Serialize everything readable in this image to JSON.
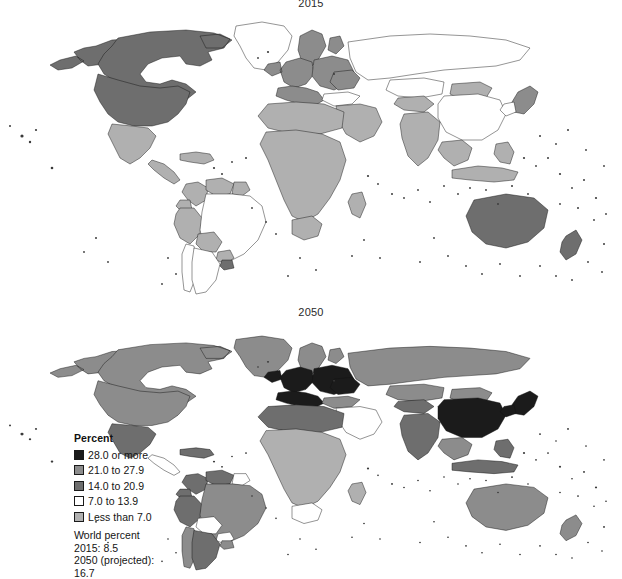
{
  "figure": {
    "panels": [
      {
        "id": "2015",
        "title": "2015"
      },
      {
        "id": "2050",
        "title": "2050"
      }
    ]
  },
  "legend": {
    "title": "Percent",
    "items": [
      {
        "label": "28.0 or more",
        "color": "#1b1b1b"
      },
      {
        "label": "21.0 to 27.9",
        "color": "#8c8c8c"
      },
      {
        "label": "14.0 to 20.9",
        "color": "#6e6e6e"
      },
      {
        "label": "7.0 to 13.9",
        "color": "#ffffff"
      },
      {
        "label": "Less than 7.0",
        "color": "#b0b0b0"
      }
    ],
    "footer": {
      "heading": "World percent",
      "line_2015": "2015: 8.5",
      "line_2050_label": "2050 (projected):",
      "line_2050_value": "16.7"
    }
  },
  "chart_data": {
    "type": "map",
    "map_projection": "world-equirectangular",
    "legend_position": "lower-left",
    "value_units": "percent",
    "classes": [
      {
        "label": "28.0 or more",
        "min": 28.0,
        "max": null,
        "color": "#1b1b1b"
      },
      {
        "label": "21.0 to 27.9",
        "min": 21.0,
        "max": 27.9,
        "color": "#8c8c8c"
      },
      {
        "label": "14.0 to 20.9",
        "min": 14.0,
        "max": 20.9,
        "color": "#6e6e6e"
      },
      {
        "label": "7.0 to 13.9",
        "min": 7.0,
        "max": 13.9,
        "color": "#ffffff"
      },
      {
        "label": "Less than 7.0",
        "min": null,
        "max": 6.9,
        "color": "#b0b0b0"
      }
    ],
    "world_values": {
      "2015": 8.5,
      "2050": 16.7
    },
    "panels": [
      {
        "year": "2015",
        "regions": {
          "greenland": "7.0 to 13.9",
          "canada": "14.0 to 20.9",
          "alaska": "14.0 to 20.9",
          "united_states": "14.0 to 20.9",
          "mexico": "Less than 7.0",
          "central_america": "Less than 7.0",
          "caribbean": "Less than 7.0",
          "colombia": "Less than 7.0",
          "venezuela": "Less than 7.0",
          "guyanas": "Less than 7.0",
          "brazil": "7.0 to 13.9",
          "peru": "Less than 7.0",
          "bolivia": "Less than 7.0",
          "chile": "7.0 to 13.9",
          "argentina": "7.0 to 13.9",
          "uruguay": "14.0 to 20.9",
          "paraguay": "Less than 7.0",
          "ecuador": "Less than 7.0",
          "western_europe": "21.0 to 27.9",
          "northern_europe": "21.0 to 27.9",
          "southern_europe": "21.0 to 27.9",
          "eastern_europe": "21.0 to 27.9",
          "russia": "7.0 to 13.9",
          "ukraine": "21.0 to 27.9",
          "turkey": "7.0 to 13.9",
          "middle_east": "Less than 7.0",
          "north_africa": "Less than 7.0",
          "sub_saharan_africa": "Less than 7.0",
          "south_africa": "Less than 7.0",
          "madagascar": "Less than 7.0",
          "central_asia": "Less than 7.0",
          "kazakhstan": "7.0 to 13.9",
          "mongolia": "Less than 7.0",
          "china": "7.0 to 13.9",
          "japan": "21.0 to 27.9",
          "south_korea": "7.0 to 13.9",
          "india": "Less than 7.0",
          "southeast_asia": "Less than 7.0",
          "indonesia": "Less than 7.0",
          "philippines": "Less than 7.0",
          "australia": "14.0 to 20.9",
          "new_zealand": "14.0 to 20.9"
        }
      },
      {
        "year": "2050",
        "regions": {
          "greenland": "21.0 to 27.9",
          "canada": "21.0 to 27.9",
          "alaska": "21.0 to 27.9",
          "united_states": "21.0 to 27.9",
          "mexico": "14.0 to 20.9",
          "central_america": "7.0 to 13.9",
          "caribbean": "14.0 to 20.9",
          "colombia": "14.0 to 20.9",
          "venezuela": "14.0 to 20.9",
          "guyanas": "7.0 to 13.9",
          "brazil": "21.0 to 27.9",
          "peru": "14.0 to 20.9",
          "bolivia": "7.0 to 13.9",
          "chile": "21.0 to 27.9",
          "argentina": "14.0 to 20.9",
          "uruguay": "21.0 to 27.9",
          "paraguay": "7.0 to 13.9",
          "ecuador": "14.0 to 20.9",
          "western_europe": "28.0 or more",
          "northern_europe": "21.0 to 27.9",
          "southern_europe": "28.0 or more",
          "eastern_europe": "28.0 or more",
          "russia": "21.0 to 27.9",
          "ukraine": "28.0 or more",
          "turkey": "21.0 to 27.9",
          "middle_east": "7.0 to 13.9",
          "north_africa": "14.0 to 20.9",
          "sub_saharan_africa": "Less than 7.0",
          "south_africa": "7.0 to 13.9",
          "madagascar": "Less than 7.0",
          "central_asia": "14.0 to 20.9",
          "kazakhstan": "21.0 to 27.9",
          "mongolia": "21.0 to 27.9",
          "china": "28.0 or more",
          "japan": "28.0 or more",
          "south_korea": "28.0 or more",
          "india": "14.0 to 20.9",
          "southeast_asia": "21.0 to 27.9",
          "indonesia": "14.0 to 20.9",
          "philippines": "14.0 to 20.9",
          "australia": "21.0 to 27.9",
          "new_zealand": "21.0 to 27.9"
        }
      }
    ]
  }
}
